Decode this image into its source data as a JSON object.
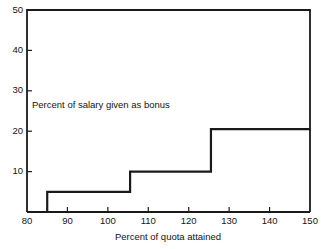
{
  "chart_data": {
    "type": "bar",
    "title": "",
    "subtitle": "",
    "xlabel": "Percent of quota attained",
    "ylabel": "",
    "annotation": "Percent of salary given as bonus",
    "xlim": [
      80,
      150
    ],
    "ylim": [
      0,
      50
    ],
    "xticks": [
      80,
      90,
      100,
      110,
      120,
      130,
      140,
      150
    ],
    "yticks": [
      10,
      20,
      30,
      40,
      50
    ],
    "xtick_labels": [
      "80",
      "90",
      "100",
      "110",
      "120",
      "130",
      "140",
      "150"
    ],
    "ytick_labels": [
      "10",
      "20",
      "30",
      "40",
      "50"
    ],
    "grid": false,
    "legend": false,
    "series": [
      {
        "name": "Percent of salary given as bonus",
        "bins": [
          {
            "x_start": 85,
            "x_end": 105.5,
            "value": 5
          },
          {
            "x_start": 105.5,
            "x_end": 125.5,
            "value": 10
          },
          {
            "x_start": 125.5,
            "x_end": 150,
            "value": 20.5
          }
        ]
      }
    ],
    "colors": {
      "line": "#1a1a1a",
      "background": "#ffffff",
      "text": "#141414"
    }
  },
  "labels": {
    "x_axis_title": "Percent of quota attained",
    "annotation_text": "Percent of salary given as bonus",
    "y_50": "50",
    "y_40": "40",
    "y_30": "30",
    "y_20": "20",
    "y_10": "10",
    "x_80": "80",
    "x_90": "90",
    "x_100": "100",
    "x_110": "110",
    "x_120": "120",
    "x_130": "130",
    "x_140": "140",
    "x_150": "150"
  }
}
